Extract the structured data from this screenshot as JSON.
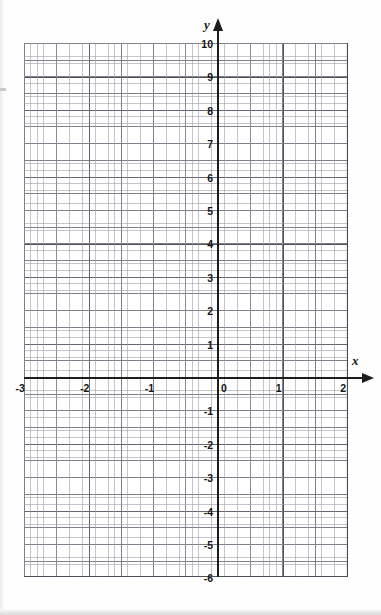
{
  "figure": {
    "type": "coordinate-grid"
  },
  "axes": {
    "x_name": "x",
    "y_name": "y",
    "origin_label": "0"
  },
  "chart_data": {
    "type": "scatter",
    "title": "",
    "subtitle": "",
    "xlabel": "x",
    "ylabel": "y",
    "xlim": [
      -3,
      2
    ],
    "ylim": [
      -6,
      10
    ],
    "xticks": [
      -3,
      -2,
      -1,
      0,
      1,
      2
    ],
    "yticks": [
      -6,
      -5,
      -4,
      -3,
      -2,
      -1,
      0,
      1,
      2,
      3,
      4,
      5,
      6,
      7,
      8,
      9,
      10
    ],
    "xtick_labels": [
      "-3",
      "-2",
      "-1",
      "0",
      "1",
      "2"
    ],
    "ytick_labels": [
      "-6",
      "-5",
      "-4",
      "-3",
      "-2",
      "-1",
      "1",
      "2",
      "3",
      "4",
      "5",
      "6",
      "7",
      "8",
      "9",
      "10"
    ],
    "grid": true,
    "grid_minor": true,
    "minor_divisions_x": 10,
    "minor_divisions_y": 5,
    "half_unit_lines": true,
    "legend": null,
    "series": [],
    "values": [],
    "annotations": []
  },
  "ticks": {
    "y_labels": [
      {
        "text": "10",
        "value": 10
      },
      {
        "text": "9",
        "value": 9
      },
      {
        "text": "8",
        "value": 8
      },
      {
        "text": "7",
        "value": 7
      },
      {
        "text": "6",
        "value": 6
      },
      {
        "text": "5",
        "value": 5
      },
      {
        "text": "4",
        "value": 4
      },
      {
        "text": "3",
        "value": 3
      },
      {
        "text": "2",
        "value": 2
      },
      {
        "text": "1",
        "value": 1
      },
      {
        "text": "-1",
        "value": -1
      },
      {
        "text": "-2",
        "value": -2
      },
      {
        "text": "-3",
        "value": -3
      },
      {
        "text": "-4",
        "value": -4
      },
      {
        "text": "-5",
        "value": -5
      },
      {
        "text": "-6",
        "value": -6
      }
    ],
    "x_labels": [
      {
        "text": "-3",
        "value": -3
      },
      {
        "text": "-2",
        "value": -2
      },
      {
        "text": "-1",
        "value": -1
      },
      {
        "text": "0",
        "value": 0
      },
      {
        "text": "1",
        "value": 1
      },
      {
        "text": "2",
        "value": 2
      }
    ]
  },
  "colors": {
    "axis": "#1d1d1d",
    "grid_major": "#46464f",
    "grid_medium": "#696976",
    "grid_minor": "#9696a0",
    "background": "#ffffff",
    "text": "#151515"
  }
}
